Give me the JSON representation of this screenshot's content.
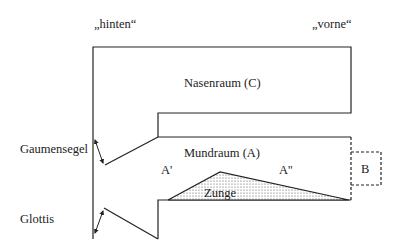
{
  "diagram": {
    "direction_labels": {
      "back": "„hinten“",
      "front": "„vorne“"
    },
    "regions": {
      "nasal": "Nasenraum (C)",
      "oral": "Mundraum (A)",
      "oral_back": "A'",
      "oral_front": "A''",
      "lips": "B",
      "tongue": "Zunge"
    },
    "side_labels": {
      "velum": "Gaumensegel",
      "glottis": "Glottis"
    },
    "colors": {
      "line": "#222222",
      "background": "#ffffff",
      "tongue_dots": "#555555"
    }
  }
}
